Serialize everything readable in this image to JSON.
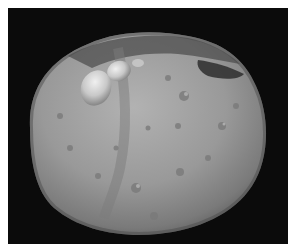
{
  "image": {
    "subject": "asteroid",
    "background_color": "#0b0b0b",
    "border_color": "#ffffff",
    "surface_color": "#9a9a9a",
    "highlight_color": "#d8d8d8",
    "shadow_color": "#3a3a3a"
  }
}
